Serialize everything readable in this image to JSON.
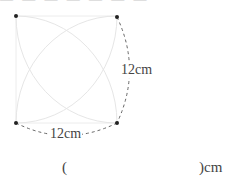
{
  "header": {
    "truncated_text": "— — — — — — —"
  },
  "figure": {
    "shape": "square with four inner quarter-circle arcs",
    "side_right_label": "12cm",
    "side_bottom_label": "12cm",
    "colors": {
      "arc_stroke": "#e6e6e6",
      "dashed_stroke": "#666666",
      "vertex": "#222222"
    }
  },
  "answer": {
    "open_paren": "(",
    "close_unit": ")cm",
    "value": ""
  }
}
